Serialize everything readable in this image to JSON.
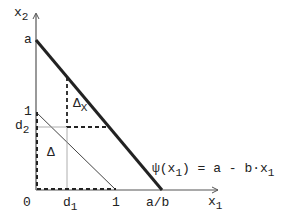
{
  "diagram": {
    "axes": {
      "x_label": "x",
      "x_sub": "1",
      "y_label": "x",
      "y_sub": "2",
      "origin": "0"
    },
    "y_ticks": {
      "a": "a",
      "one": "1",
      "d2": "d",
      "d2_sub": "2"
    },
    "x_ticks": {
      "d1": "d",
      "d1_sub": "1",
      "one": "1",
      "a_over_b": "a/b"
    },
    "regions": {
      "delta": "Δ",
      "delta_x": "Δ",
      "delta_x_sub": "X"
    },
    "formula": {
      "lhs": "ψ(x",
      "lhs_sub": "1",
      "rhs": ") = a - b·x",
      "rhs_sub": "1"
    },
    "colors": {
      "line": "#222222",
      "thin": "#444444",
      "dotted": "#888888"
    }
  }
}
